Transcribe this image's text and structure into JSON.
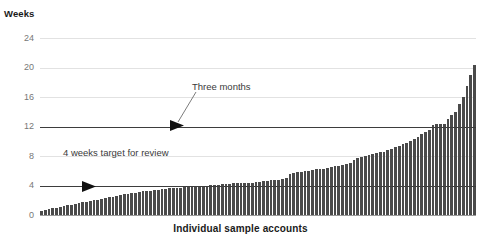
{
  "chart_data": {
    "type": "bar",
    "title": "",
    "ylabel": "Weeks",
    "xlabel": "Individual sample accounts",
    "ylim": [
      0,
      24
    ],
    "yticks": [
      0,
      4,
      8,
      12,
      16,
      20,
      24
    ],
    "ytick_labels": [
      "0",
      "4",
      "8",
      "12",
      "16",
      "20",
      "24"
    ],
    "grid": true,
    "legend": "none",
    "xtick_labels": [],
    "bar_color": "#4a4a4a",
    "gridline_color": "#e2e2e2",
    "reference_line_color": "#3d3d3d",
    "baseline_color": "#9a9a9a",
    "reference_lines": [
      {
        "name": "three-months",
        "value": 12,
        "label": "Three months"
      },
      {
        "name": "four-weeks-target",
        "value": 4,
        "label": "4 weeks target for review"
      }
    ],
    "annotations": [
      {
        "name": "three-months",
        "text": "Three months",
        "points_to_value": 12
      },
      {
        "name": "four-weeks-target",
        "text": "4 weeks target for review",
        "points_to_value": 4
      }
    ],
    "series_name": "Weeks to process",
    "values": [
      0.5,
      0.7,
      0.8,
      0.9,
      1.0,
      1.1,
      1.2,
      1.3,
      1.4,
      1.5,
      1.6,
      1.7,
      1.8,
      1.9,
      2.0,
      2.1,
      2.2,
      2.3,
      2.4,
      2.5,
      2.6,
      2.7,
      2.8,
      2.9,
      3.0,
      3.0,
      3.1,
      3.2,
      3.2,
      3.3,
      3.4,
      3.4,
      3.5,
      3.5,
      3.6,
      3.6,
      3.7,
      3.7,
      3.8,
      3.8,
      3.9,
      3.9,
      4.0,
      4.0,
      4.0,
      4.1,
      4.1,
      4.1,
      4.2,
      4.2,
      4.2,
      4.3,
      4.3,
      4.3,
      4.4,
      4.4,
      4.4,
      4.5,
      4.5,
      4.6,
      4.6,
      4.7,
      4.7,
      4.8,
      4.9,
      5.0,
      5.6,
      5.7,
      5.8,
      5.9,
      6.0,
      6.0,
      6.1,
      6.2,
      6.3,
      6.3,
      6.4,
      6.5,
      6.6,
      6.7,
      6.8,
      6.9,
      7.0,
      7.5,
      7.7,
      7.9,
      8.0,
      8.2,
      8.3,
      8.4,
      8.5,
      8.6,
      8.8,
      9.0,
      9.2,
      9.4,
      9.6,
      9.8,
      10.0,
      10.3,
      10.6,
      11.0,
      11.2,
      11.5,
      12.2,
      12.4,
      12.4,
      12.3,
      13.0,
      13.5,
      14.0,
      15.0,
      16.0,
      17.5,
      19.0,
      20.4
    ]
  }
}
